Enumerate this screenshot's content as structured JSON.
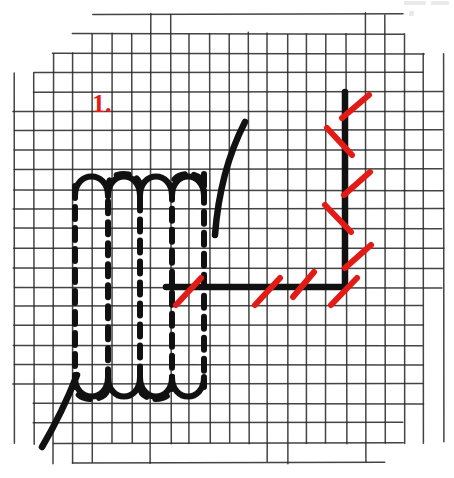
{
  "page": {
    "kind": "scanned-handwritten-worksheet",
    "background_color": "#ffffff",
    "width": 454,
    "height": 478
  },
  "annotation": {
    "label": "1.",
    "color": "#e31b17",
    "x": 92,
    "y": 112
  },
  "grid": {
    "color": "#2b2b2b",
    "cell_size": 19.5,
    "origin_x": 14,
    "origin_y": 14,
    "columns": 22,
    "rows": 23,
    "style": "hand-drawn graph paper with ragged torn edges"
  },
  "ink_color": "#111111",
  "red_color": "#e31b17",
  "shapes": {
    "boundary_line": {
      "name": "L-shaped boundary",
      "vertical": {
        "x": 345,
        "y_top": 92,
        "y_bottom": 287
      },
      "horizontal": {
        "y": 287,
        "x_left": 166,
        "x_right": 347
      }
    },
    "red_ticks_vertical": [
      {
        "x1": 342,
        "y1": 118,
        "x2": 369,
        "y2": 95
      },
      {
        "x1": 327,
        "y1": 128,
        "x2": 352,
        "y2": 155
      },
      {
        "x1": 344,
        "y1": 195,
        "x2": 370,
        "y2": 172
      },
      {
        "x1": 325,
        "y1": 205,
        "x2": 351,
        "y2": 232
      },
      {
        "x1": 345,
        "y1": 268,
        "x2": 371,
        "y2": 245
      }
    ],
    "red_ticks_horizontal": [
      {
        "x1": 176,
        "y1": 305,
        "x2": 201,
        "y2": 278
      },
      {
        "x1": 255,
        "y1": 305,
        "x2": 280,
        "y2": 278
      },
      {
        "x1": 293,
        "y1": 297,
        "x2": 314,
        "y2": 272
      },
      {
        "x1": 331,
        "y1": 305,
        "x2": 357,
        "y2": 278
      }
    ],
    "curve_top": {
      "name": "upward curve",
      "path": "M 215 235 C 218 195 228 155 245 122"
    },
    "curve_bottom": {
      "name": "downward curve",
      "path": "M 77 375 C 68 398 55 425 42 447"
    },
    "hatching": {
      "name": "serpentine dashed hatching region",
      "columns": 5,
      "x_positions": [
        75,
        108,
        140,
        172,
        204
      ],
      "top_y": 186,
      "bottom_y": 387,
      "dash_pattern": "12 9",
      "description": "vertical dashed strokes joined by rounded arcs at top and bottom"
    }
  }
}
